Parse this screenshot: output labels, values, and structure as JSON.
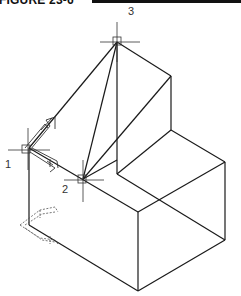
{
  "figure": {
    "label": "FIGURE 23-6"
  },
  "points": [
    {
      "id": "1",
      "label": "1",
      "x": 28,
      "y": 148
    },
    {
      "id": "2",
      "label": "2",
      "x": 83,
      "y": 179
    },
    {
      "id": "3",
      "label": "3",
      "x": 117,
      "y": 42
    }
  ],
  "colors": {
    "line": "#1a1a1a",
    "dashed": "#555555",
    "background": "#ffffff"
  }
}
